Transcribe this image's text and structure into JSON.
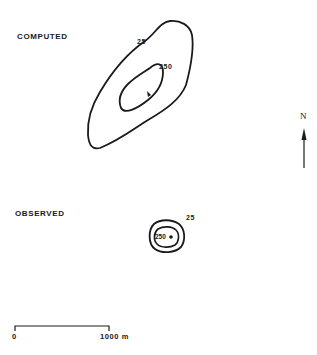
{
  "panels": {
    "computed": {
      "title": "COMPUTED",
      "contours": [
        {
          "level_label": "25"
        },
        {
          "level_label": "250"
        }
      ]
    },
    "observed": {
      "title": "OBSERVED",
      "contours": [
        {
          "level_label": "25"
        },
        {
          "level_label": "250"
        }
      ]
    }
  },
  "north_arrow": {
    "label": "N"
  },
  "scale_bar": {
    "start_label": "0",
    "end_label": "1000 m"
  },
  "colors": {
    "ink": "#1a1a1a",
    "background": "#ffffff"
  }
}
